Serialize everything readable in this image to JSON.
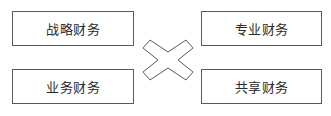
{
  "diagram": {
    "boxes": [
      {
        "id": "strategic",
        "label": "战略财务",
        "position": "top-left"
      },
      {
        "id": "business",
        "label": "业务财务",
        "position": "bottom-left"
      },
      {
        "id": "professional",
        "label": "专业财务",
        "position": "top-right"
      },
      {
        "id": "shared",
        "label": "共享财务",
        "position": "bottom-right"
      }
    ],
    "connector": {
      "icon": "cross-x-icon",
      "meaning": "interconnection between the four finance roles"
    },
    "colors": {
      "border": "#5a5a5a",
      "text": "#2a2a2a",
      "background": "#ffffff"
    }
  }
}
